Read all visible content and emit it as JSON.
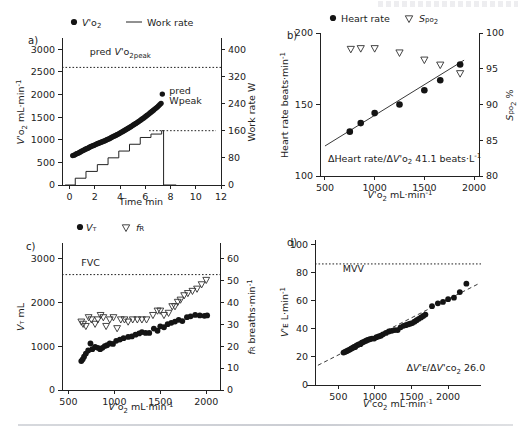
{
  "figure": {
    "panel_letters": {
      "a": "a)",
      "b": "b)",
      "c": "c)",
      "d": "d)"
    }
  },
  "chart_data": [
    {
      "id": "panel-a",
      "type": "scatter",
      "title": "a)",
      "xlabel": "Time min",
      "ylabel": "V'O2 mL·min⁻¹",
      "ylabel_right": "Work rate W",
      "xlim": [
        -0.6,
        12
      ],
      "ylim": [
        0,
        3250
      ],
      "ylim_right": [
        0,
        433
      ],
      "xticks": [
        0,
        2,
        4,
        6,
        8,
        10,
        12
      ],
      "xticklabels": [
        "0",
        "2",
        "4",
        "6",
        "8",
        "10",
        "12"
      ],
      "yticks": [
        0,
        500,
        1000,
        1500,
        2000,
        2500,
        3000
      ],
      "yticklabels": [
        "0",
        "500",
        "1000",
        "1500",
        "2000",
        "2500",
        "3000"
      ],
      "yticks_right": [
        0,
        80,
        160,
        240,
        320,
        400
      ],
      "yticklabels_right": [
        "0",
        "80",
        "160",
        "240",
        "320",
        "400"
      ],
      "grid": false,
      "legend": [
        {
          "label": "V'O2",
          "marker": "filled-circle"
        },
        {
          "label": "Work rate",
          "marker": "line"
        }
      ],
      "annotations": [
        {
          "text": "pred V'O2peak",
          "x": 1.6,
          "y": 2870
        },
        {
          "text": "pred",
          "x": 7.9,
          "y": 2010
        },
        {
          "text": "Wpeak",
          "x": 7.9,
          "y": 1790
        }
      ],
      "reference_lines": [
        {
          "name": "pred V'O2peak",
          "y": 2600,
          "style": "dotted"
        },
        {
          "name": "pred Wpeak",
          "y_right": 160,
          "x_start": 6.3,
          "x_end": 11.6,
          "style": "dotted"
        }
      ],
      "series": [
        {
          "name": "V'O2",
          "marker": "filled-circle",
          "x": [
            0.25,
            0.35,
            0.45,
            0.55,
            0.65,
            0.75,
            0.85,
            0.95,
            1.05,
            1.15,
            1.25,
            1.35,
            1.45,
            1.55,
            1.65,
            1.75,
            1.85,
            1.95,
            2.05,
            2.15,
            2.25,
            2.35,
            2.45,
            2.55,
            2.65,
            2.75,
            2.85,
            2.95,
            3.05,
            3.15,
            3.25,
            3.35,
            3.45,
            3.55,
            3.65,
            3.75,
            3.85,
            3.95,
            4.05,
            4.15,
            4.25,
            4.35,
            4.45,
            4.55,
            4.65,
            4.75,
            4.85,
            4.95,
            5.05,
            5.15,
            5.25,
            5.35,
            5.45,
            5.55,
            5.65,
            5.75,
            5.85,
            5.95,
            6.05,
            6.15,
            6.25,
            6.35,
            6.45,
            6.55,
            6.65,
            6.75,
            6.85,
            6.95,
            7.05,
            7.15,
            7.25,
            7.35
          ],
          "y": [
            650,
            660,
            672,
            690,
            700,
            712,
            730,
            748,
            760,
            775,
            790,
            800,
            815,
            830,
            845,
            858,
            870,
            880,
            893,
            905,
            918,
            930,
            940,
            950,
            962,
            975,
            985,
            1000,
            1012,
            1025,
            1040,
            1055,
            1070,
            1082,
            1095,
            1112,
            1125,
            1140,
            1158,
            1172,
            1190,
            1205,
            1220,
            1238,
            1255,
            1272,
            1290,
            1308,
            1325,
            1342,
            1362,
            1380,
            1398,
            1418,
            1438,
            1458,
            1478,
            1500,
            1520,
            1542,
            1562,
            1585,
            1608,
            1630,
            1655,
            1678,
            1700,
            1722,
            1750,
            1778,
            1805,
            2010
          ]
        },
        {
          "name": "Work rate",
          "marker": "step-line",
          "step_x": [
            -0.35,
            0.45,
            0.45,
            1.3,
            1.3,
            2.2,
            2.2,
            3.05,
            3.05,
            3.9,
            3.9,
            4.75,
            4.75,
            5.6,
            5.6,
            6.45,
            6.45,
            7.3,
            7.3,
            7.45,
            7.45,
            8.45
          ],
          "step_w": [
            0,
            0,
            20,
            20,
            40,
            40,
            60,
            60,
            80,
            80,
            100,
            100,
            120,
            120,
            140,
            140,
            150,
            150,
            160,
            160,
            0,
            0
          ]
        }
      ]
    },
    {
      "id": "panel-b",
      "type": "scatter",
      "title": "b)",
      "xlabel": "V'O2 mL·min⁻¹",
      "ylabel": "Heart rate beats·min⁻¹",
      "ylabel_right": "SpO2 %",
      "xlim": [
        450,
        2050
      ],
      "ylim": [
        100,
        200
      ],
      "ylim_right": [
        80,
        100
      ],
      "xticks": [
        500,
        1000,
        1500,
        2000
      ],
      "xticklabels": [
        "500",
        "1000",
        "1500",
        "2000"
      ],
      "yticks": [
        100,
        150,
        200
      ],
      "yticklabels": [
        "100",
        "150",
        "200"
      ],
      "yticks_right": [
        80,
        85,
        90,
        95,
        100
      ],
      "yticklabels_right": [
        "80",
        "85",
        "90",
        "95",
        "100"
      ],
      "grid": false,
      "legend": [
        {
          "label": "Heart rate",
          "marker": "filled-circle"
        },
        {
          "label": "SpO2",
          "marker": "open-triangle-down"
        }
      ],
      "annotations": [
        {
          "text": "ΔHeart rate/ΔV'O2 41.1 beats·L⁻¹",
          "x": 530,
          "y": 110
        }
      ],
      "fit_line": {
        "name": "heart rate regression",
        "x": [
          500,
          1900
        ],
        "y": [
          121,
          181
        ],
        "style": "solid"
      },
      "series": [
        {
          "name": "Heart rate",
          "marker": "filled-circle",
          "x": [
            750,
            860,
            1000,
            1250,
            1500,
            1660,
            1860
          ],
          "y": [
            131,
            137,
            144,
            150,
            160,
            167,
            178
          ]
        },
        {
          "name": "SpO2",
          "marker": "open-triangle-down",
          "x": [
            760,
            860,
            1000,
            1250,
            1500,
            1660,
            1860
          ],
          "y_right": [
            97.7,
            97.8,
            97.8,
            97.2,
            96.2,
            95.5,
            94.3
          ]
        }
      ]
    },
    {
      "id": "panel-c",
      "type": "scatter",
      "title": "c)",
      "xlabel": "V'O2 mL·min⁻¹",
      "ylabel": "VT mL",
      "ylabel_right": "fR breaths·min⁻¹",
      "xlim": [
        430,
        2150
      ],
      "ylim": [
        0,
        3350
      ],
      "ylim_right": [
        0,
        67
      ],
      "xticks": [
        500,
        1000,
        1500,
        2000
      ],
      "xticklabels": [
        "500",
        "1000",
        "1500",
        "2000"
      ],
      "yticks": [
        0,
        1000,
        2000,
        3000
      ],
      "yticklabels": [
        "0",
        "1000",
        "2000",
        "3000"
      ],
      "yticks_right": [
        0,
        10,
        20,
        30,
        40,
        50,
        60
      ],
      "yticklabels_right": [
        "0",
        "10",
        "20",
        "30",
        "40",
        "50",
        "60"
      ],
      "grid": false,
      "legend": [
        {
          "label": "VT",
          "marker": "filled-circle"
        },
        {
          "label": "fR",
          "marker": "open-triangle-down"
        }
      ],
      "annotations": [
        {
          "text": "FVC",
          "x": 640,
          "y": 2830
        }
      ],
      "reference_lines": [
        {
          "name": "FVC",
          "y": 2630,
          "style": "dotted"
        }
      ],
      "series": [
        {
          "name": "VT",
          "marker": "filled-circle",
          "x": [
            640,
            655,
            670,
            690,
            715,
            740,
            760,
            790,
            820,
            845,
            870,
            895,
            920,
            950,
            985,
            1020,
            1060,
            1100,
            1150,
            1190,
            1230,
            1270,
            1300,
            1340,
            1380,
            1430,
            1470,
            1500,
            1540,
            1580,
            1620,
            1660,
            1700,
            1740,
            1790,
            1830,
            1880,
            1930,
            1980,
            2010
          ],
          "y": [
            660,
            700,
            760,
            830,
            900,
            1060,
            930,
            980,
            960,
            930,
            960,
            1000,
            1020,
            1060,
            1050,
            1120,
            1150,
            1180,
            1210,
            1220,
            1260,
            1290,
            1320,
            1300,
            1300,
            1400,
            1350,
            1450,
            1430,
            1500,
            1530,
            1560,
            1600,
            1570,
            1660,
            1680,
            1710,
            1700,
            1690,
            1700
          ]
        },
        {
          "name": "fR",
          "marker": "open-triangle-down",
          "x": [
            640,
            660,
            690,
            720,
            750,
            790,
            820,
            850,
            880,
            910,
            950,
            990,
            1030,
            1070,
            1110,
            1150,
            1200,
            1250,
            1300,
            1350,
            1420,
            1470,
            1500,
            1540,
            1590,
            1630,
            1660,
            1690,
            1720,
            1760,
            1800,
            1850,
            1900,
            1950,
            2000
          ],
          "y_right": [
            31,
            30,
            29,
            33,
            32,
            30,
            32,
            34,
            33,
            29,
            32,
            33,
            28,
            32,
            32,
            31,
            32,
            32,
            32,
            32,
            34,
            36,
            36,
            34,
            35,
            38,
            38,
            40,
            41,
            43,
            44,
            45,
            46,
            48,
            50
          ]
        }
      ]
    },
    {
      "id": "panel-d",
      "type": "scatter",
      "title": "d)",
      "xlabel": "V'CO2 mL·min⁻¹",
      "ylabel": "V'E L·min⁻¹",
      "xlim": [
        180,
        2450
      ],
      "ylim": [
        0,
        103
      ],
      "xticks": [
        500,
        1000,
        1500,
        2000
      ],
      "xticklabels": [
        "500",
        "1000",
        "1500",
        "2000"
      ],
      "yticks": [
        0,
        20,
        40,
        60,
        80,
        100
      ],
      "yticklabels": [
        "0",
        "20",
        "40",
        "60",
        "80",
        "100"
      ],
      "grid": false,
      "legend": [],
      "annotations": [
        {
          "text": "MVV",
          "x": 560,
          "y": 80
        },
        {
          "text": "ΔV'E/ΔV'CO2 26.0",
          "x": 1430,
          "y": 10
        }
      ],
      "reference_lines": [
        {
          "name": "MVV",
          "y": 86,
          "style": "dotted"
        }
      ],
      "fit_line": {
        "name": "V'E/V'CO2 slope 26.0",
        "x": [
          220,
          2420
        ],
        "y": [
          14,
          72
        ],
        "style": "dashed"
      },
      "series": [
        {
          "name": "V'E",
          "marker": "filled-circle",
          "x": [
            570,
            590,
            610,
            630,
            650,
            665,
            680,
            700,
            715,
            730,
            745,
            765,
            785,
            800,
            820,
            840,
            860,
            880,
            900,
            930,
            960,
            990,
            1020,
            1050,
            1080,
            1110,
            1150,
            1190,
            1230,
            1270,
            1310,
            1350,
            1390,
            1420,
            1450,
            1480,
            1510,
            1540,
            1570,
            1600,
            1630,
            1660,
            1690,
            1780,
            1860,
            1930,
            2000,
            2080,
            2160,
            2250
          ],
          "y": [
            23,
            23.5,
            24,
            24.5,
            25,
            25.5,
            26,
            26.5,
            27,
            27,
            28,
            28.5,
            29,
            29,
            30,
            30.5,
            31,
            31.5,
            32,
            32.5,
            33,
            33,
            34,
            34.5,
            35,
            36,
            37,
            38,
            38.5,
            39,
            39,
            41,
            42,
            42.5,
            43,
            43.5,
            44,
            45,
            46,
            47,
            48,
            49,
            50,
            56,
            58,
            59,
            61,
            62,
            66,
            72
          ]
        }
      ]
    }
  ]
}
